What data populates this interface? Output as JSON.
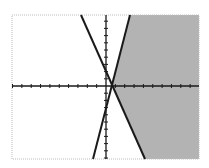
{
  "chart_data": {
    "type": "line",
    "title": "",
    "xlabel": "",
    "ylabel": "",
    "grid": false,
    "legend": null,
    "xlim": [
      -10,
      10
    ],
    "ylim": [
      -10,
      10
    ],
    "x_ticks_step": 1,
    "y_ticks_step": 1,
    "series": [
      {
        "name": "line-negative-slope",
        "style": "solid",
        "x": [
          -2.7,
          4.1
        ],
        "y": [
          10,
          -10
        ]
      },
      {
        "name": "line-positive-slope",
        "style": "solid",
        "x": [
          2.5,
          -1.4
        ],
        "y": [
          10,
          -10
        ]
      }
    ],
    "shaded_region": {
      "color": "#b3b3b3",
      "description": "right of both lines",
      "vertices": [
        [
          2.5,
          10
        ],
        [
          10,
          10
        ],
        [
          10,
          -10
        ],
        [
          4.1,
          -10
        ],
        [
          0.6,
          0.1
        ]
      ]
    },
    "colors": {
      "lines": "#1a1a1a",
      "shade": "#b3b3b3",
      "border": "#bdbdbd",
      "background": "#ffffff"
    }
  }
}
